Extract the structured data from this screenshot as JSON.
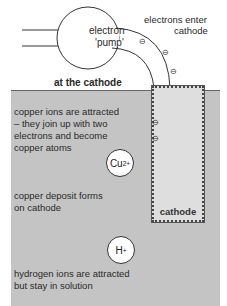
{
  "title": "at the cathode",
  "pump": {
    "label_line1": "electron",
    "label_line2": "'pump'"
  },
  "labels": {
    "electrons_enter": [
      "electrons enter",
      "cathode"
    ],
    "copper_attracted": [
      "copper ions are attracted",
      "– they join up with two",
      "electrons and become",
      "copper atoms"
    ],
    "copper_deposit": [
      "copper deposit forms",
      "on cathode"
    ],
    "hydrogen": [
      "hydrogen ions are attracted",
      "but stay in solution"
    ],
    "cathode": "cathode"
  },
  "ions": {
    "copper": {
      "symbol": "Cu",
      "charge": "2+"
    },
    "hydrogen": {
      "symbol": "H",
      "charge": "+"
    }
  },
  "electron_symbol": "⊖",
  "colors": {
    "solution": "#c4c4c4",
    "cathode": "#dedede",
    "line": "#333333"
  }
}
